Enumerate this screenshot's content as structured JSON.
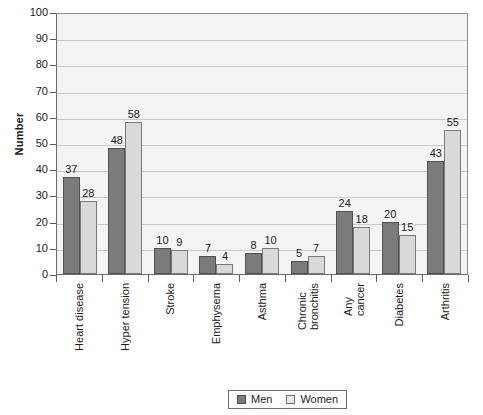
{
  "chart_data": {
    "type": "bar",
    "title": "",
    "subtitle": "",
    "xlabel": "",
    "ylabel": "Number",
    "ylim": [
      0,
      100
    ],
    "yticks": [
      0,
      10,
      20,
      30,
      40,
      50,
      60,
      70,
      80,
      90,
      100
    ],
    "ytick_labels": [
      "0",
      "10",
      "20",
      "30",
      "40",
      "50",
      "60",
      "70",
      "80",
      "90",
      "100"
    ],
    "grid": true,
    "legend_position": "bottom-center",
    "categories": [
      "Heart disease",
      "Hyper tension",
      "Stroke",
      "Emphysema",
      "Asthma",
      "Chronic bronchitis",
      "Any cancer",
      "Diabetes",
      "Arthritis"
    ],
    "category_lines": [
      [
        "Heart disease"
      ],
      [
        "Hyper tension"
      ],
      [
        "Stroke"
      ],
      [
        "Emphysema"
      ],
      [
        "Asthma"
      ],
      [
        "Chronic",
        "bronchitis"
      ],
      [
        "Any",
        "cancer"
      ],
      [
        "Diabetes"
      ],
      [
        "Arthritis"
      ]
    ],
    "series": [
      {
        "name": "Men",
        "color": "#7b7b7b",
        "values": [
          37,
          48,
          10,
          7,
          8,
          5,
          24,
          20,
          43
        ]
      },
      {
        "name": "Women",
        "color": "#d9d9d9",
        "values": [
          28,
          58,
          9,
          4,
          10,
          7,
          18,
          15,
          55
        ]
      }
    ],
    "data_labels": true
  },
  "legend": {
    "items": [
      {
        "label": "Men",
        "swatch": "men-swatch"
      },
      {
        "label": "Women",
        "swatch": "women-swatch"
      }
    ]
  },
  "colors": {
    "men_bar": "#7b7b7b",
    "women_bar": "#d9d9d9",
    "plot_background": "#f4f4f4",
    "gridline": "#c9c9c9",
    "axis": "#5a5a5a",
    "text": "#1a1a1a"
  }
}
